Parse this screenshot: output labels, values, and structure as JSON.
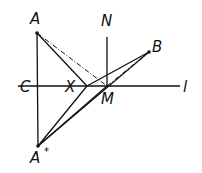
{
  "diagram": {
    "labels": {
      "A": "A",
      "A_star": "A",
      "star": "*",
      "B": "B",
      "C": "C",
      "X": "X",
      "M": "M",
      "N": "N",
      "l": "l"
    },
    "points": {
      "A": [
        37,
        33
      ],
      "A_star": [
        38,
        146
      ],
      "B": [
        149,
        52
      ],
      "C": [
        37,
        86
      ],
      "X": [
        87,
        86
      ],
      "M": [
        107,
        86
      ],
      "N": [
        107,
        37
      ]
    },
    "line_color": "#111111"
  }
}
